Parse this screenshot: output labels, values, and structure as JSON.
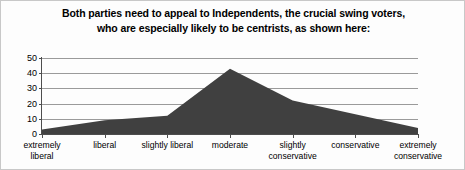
{
  "title": {
    "line1": "Both parties need to appeal to Independents, the crucial swing voters,",
    "line2": "who are especially likely to be centrists, as shown here:"
  },
  "colors": {
    "area_fill": "#404040",
    "gridline": "#9a9a9a",
    "axis": "#4d4d4d",
    "text": "#000000",
    "background": "#fdfdfd",
    "border": "#c8c8c8"
  },
  "chart_data": {
    "type": "area",
    "title": "Both parties need to appeal to Independents, the crucial swing voters, who are especially likely to be centrists, as shown here:",
    "categories": [
      "extremely liberal",
      "liberal",
      "slightly liberal",
      "moderate",
      "slightly conservative",
      "conservative",
      "extremely conservative"
    ],
    "category_lines": [
      [
        "extremely",
        "liberal"
      ],
      [
        "liberal",
        ""
      ],
      [
        "slightly liberal",
        ""
      ],
      [
        "moderate",
        ""
      ],
      [
        "slightly",
        "conservative"
      ],
      [
        "conservative",
        ""
      ],
      [
        "extremely",
        "conservative"
      ]
    ],
    "values": [
      3,
      9,
      12,
      43,
      22,
      13,
      4
    ],
    "xlabel": "",
    "ylabel": "",
    "ylim": [
      0,
      50
    ],
    "yticks": [
      0,
      10,
      20,
      30,
      40,
      50
    ],
    "ytick_labels": [
      "0",
      "10",
      "20",
      "30",
      "40",
      "50"
    ],
    "grid": true,
    "legend": false
  }
}
